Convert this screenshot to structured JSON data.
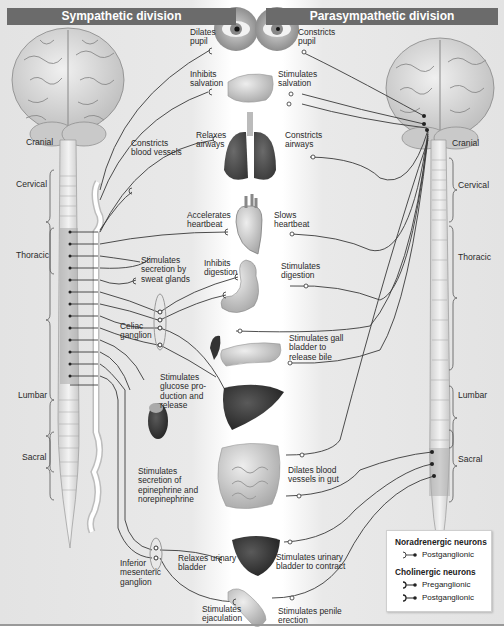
{
  "headers": {
    "sympathetic": "Sympathetic division",
    "parasympathetic": "Parasympathetic division"
  },
  "spinal_segments_left": [
    "Cranial",
    "Cervical",
    "Thoracic",
    "Lumbar",
    "Sacral"
  ],
  "spinal_segments_right": [
    "Cranial",
    "Cervical",
    "Thoracic",
    "Lumbar",
    "Sacral"
  ],
  "organs": [
    "eye",
    "salivary-gland",
    "lungs",
    "heart",
    "stomach",
    "gallbladder-pancreas",
    "liver",
    "adrenal-gland",
    "intestines",
    "urinary-bladder",
    "penis"
  ],
  "sympathetic_effects": {
    "dilates_pupil": "Dilates\npupil",
    "inhibits_salivation": "Inhibits\nsalvation",
    "constricts_blood_vessels": "Constricts\nblood vessels",
    "relaxes_airways": "Relaxes\nairways",
    "accelerates_heartbeat": "Accelerates\nheartbeat",
    "stimulates_sweat": "Stimulates\nsecretion by\nsweat glands",
    "inhibits_digestion": "Inhibits\ndigestion",
    "celiac_ganglion": "Celiac\nganglion",
    "stimulates_glucose": "Stimulates\nglucose pro-\nduction and\nrelease",
    "stimulates_epinephrine": "Stimulates\nsecretion of\nepinephrine and\nnorepinephrine",
    "relaxes_bladder": "Relaxes urinary\nbladder",
    "inferior_mesenteric": "Inferior\nmesenteric\nganglion",
    "stimulates_ejaculation": "Stimulates\nejaculation"
  },
  "parasympathetic_effects": {
    "constricts_pupil": "Constricts\npupil",
    "stimulates_salivation": "Stimulates\nsalvation",
    "constricts_airways": "Constricts\nairways",
    "slows_heartbeat": "Slows\nheartbeat",
    "stimulates_digestion": "Stimulates\ndigestion",
    "stimulates_gallbladder": "Stimulates gall\nbladder to\nrelease bile",
    "dilates_gut_vessels": "Dilates blood\nvessels in gut",
    "stimulates_bladder": "Stimulates urinary\nbladder to contract",
    "stimulates_erection": "Stimulates penile\nerection"
  },
  "legend": {
    "noradrenergic_title": "Noradrenergic neurons",
    "noradrenergic_items": [
      "Postganglionic"
    ],
    "cholinergic_title": "Cholinergic neurons",
    "cholinergic_items": [
      "Preganglionic",
      "Postganglionic"
    ]
  },
  "colors": {
    "header_bg": "#6b6b6b",
    "side_bg": "#e6e6e6",
    "center_bg": "#ffffff",
    "nerve_line": "#3a3a3a"
  }
}
